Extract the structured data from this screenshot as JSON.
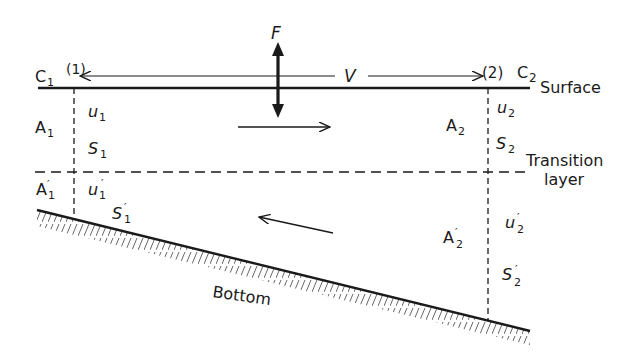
{
  "diagram": {
    "type": "estuary two-layer flow cross-section",
    "sections": [
      {
        "id": "1",
        "label": "(1)",
        "concentration": "C",
        "concentration_sub": "1"
      },
      {
        "id": "2",
        "label": "(2)",
        "concentration": "C",
        "concentration_sub": "2"
      }
    ],
    "top_labels": {
      "force": "F",
      "volume": "V"
    },
    "layer_labels": {
      "surface": "Surface",
      "transition_line1": "Transition",
      "transition_line2": "layer",
      "bottom": "Bottom"
    },
    "upper_layer": {
      "A1": {
        "base": "A",
        "sub": "1"
      },
      "u1": {
        "base": "u",
        "sub": "1"
      },
      "S1": {
        "base": "S",
        "sub": "1"
      },
      "A2": {
        "base": "A",
        "sub": "2"
      },
      "u2": {
        "base": "u",
        "sub": "2"
      },
      "S2": {
        "base": "S",
        "sub": "2"
      }
    },
    "lower_layer": {
      "A1p": {
        "base": "A",
        "prime": "′",
        "sub": "1"
      },
      "u1p": {
        "base": "u",
        "prime": "′",
        "sub": "1"
      },
      "S1p": {
        "base": "S",
        "prime": "′",
        "sub": "1"
      },
      "A2p": {
        "base": "A",
        "prime": "′",
        "sub": "2"
      },
      "u2p": {
        "base": "u",
        "prime": "′",
        "sub": "2"
      },
      "S2p": {
        "base": "S",
        "prime": "′",
        "sub": "2"
      }
    },
    "flow_arrows": {
      "upper": "seaward (right)",
      "lower": "landward (left)"
    },
    "colors": {
      "ink": "#1a1a1a",
      "background": "#ffffff"
    }
  }
}
